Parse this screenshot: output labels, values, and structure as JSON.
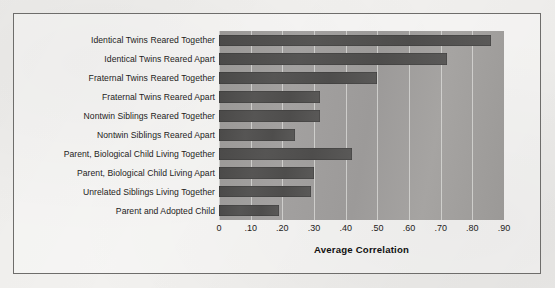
{
  "figure": {
    "background_color": "#f2f1ef",
    "frame_color": "#6e6d6b",
    "plot_background_color": "#9e9c9a",
    "bar_color": "#4e4d4c",
    "gridline_color": "#deddd b"
  },
  "chart_data": {
    "type": "bar",
    "orientation": "horizontal",
    "title": "",
    "subtitle": "",
    "xlabel": "Average Correlation",
    "ylabel": "",
    "xlim": [
      0,
      0.9
    ],
    "grid": true,
    "legend": false,
    "legend_position": "none",
    "xticks": [
      0,
      0.1,
      0.2,
      0.3,
      0.4,
      0.5,
      0.6,
      0.7,
      0.8,
      0.9
    ],
    "xticklabels": [
      "0",
      ".10",
      ".20",
      ".30",
      ".40",
      ".50",
      ".60",
      ".70",
      ".80",
      ".90"
    ],
    "categories": [
      "Identical Twins Reared Together",
      "Identical Twins Reared Apart",
      "Fraternal Twins Reared Together",
      "Fraternal Twins Reared Apart",
      "Nontwin Siblings Reared Together",
      "Nontwin Siblings Reared Apart",
      "Parent, Biological Child Living Together",
      "Parent, Biological Child Living Apart",
      "Unrelated Siblings Living Together",
      "Parent and Adopted Child"
    ],
    "values": [
      0.86,
      0.72,
      0.5,
      0.32,
      0.32,
      0.24,
      0.42,
      0.3,
      0.29,
      0.19
    ]
  }
}
